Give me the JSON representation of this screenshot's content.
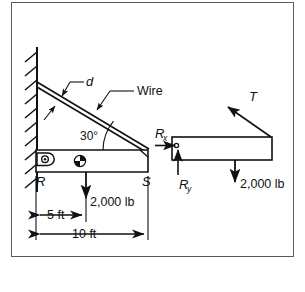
{
  "figure": {
    "border_color": "#5a5a5a",
    "line_color": "#111111",
    "background": "#ffffff"
  },
  "left_diagram": {
    "name": "physical-setup",
    "labels": {
      "wire_thickness": "d",
      "wire": "Wire",
      "angle": "30°",
      "point_left": "R",
      "point_right": "S",
      "load": "2,000 lb",
      "dim_half": "5 ft",
      "dim_full": "10 ft"
    },
    "elements": {
      "wall": "hatched-wall",
      "pin_support": "pin-joint",
      "center_of_gravity": "cg-symbol",
      "beam": "horizontal-beam",
      "wire_member": "inclined-wire"
    }
  },
  "right_diagram": {
    "name": "free-body-diagram",
    "labels": {
      "tension": "T",
      "reaction_x": "R",
      "reaction_x_sub": "x",
      "reaction_y": "R",
      "reaction_y_sub": "y",
      "load": "2,000 lb"
    },
    "elements": {
      "beam": "fbd-beam",
      "pin": "fbd-pin-dot"
    }
  }
}
